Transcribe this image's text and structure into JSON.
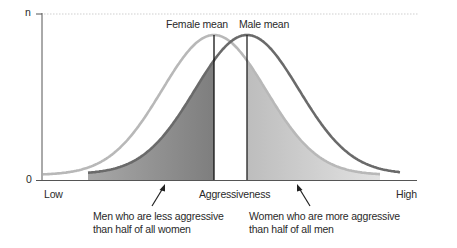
{
  "chart_data": {
    "type": "area",
    "title": "",
    "xlabel": "Aggressiveness",
    "ylabel": "",
    "x_ticks": [
      "Low",
      "High"
    ],
    "y_ticks": [
      "0",
      "n"
    ],
    "series": [
      {
        "name": "Female",
        "mean_label": "Female mean",
        "relative_mean": 0.47,
        "color": "#b5b5b5"
      },
      {
        "name": "Male",
        "mean_label": "Male mean",
        "relative_mean": 0.57,
        "color": "#6e6e6e"
      }
    ],
    "shaded_regions": [
      {
        "label": "Men who are less aggressive than half of all women",
        "series": "Male",
        "range": "below female mean",
        "color": "#8c8c8c"
      },
      {
        "label": "Women who are more aggressive than half of all men",
        "series": "Female",
        "range": "above male mean",
        "color": "#d4d4d4"
      }
    ],
    "grid": false,
    "top_reference_line": "dotted at n"
  },
  "labels": {
    "y_top": "n",
    "y_zero": "0",
    "x_low": "Low",
    "x_high": "High",
    "x_axis": "Aggressiveness",
    "female_mean": "Female mean",
    "male_mean": "Male mean",
    "ann_left_1": "Men who are less aggressive",
    "ann_left_2": "than half of all women",
    "ann_right_1": "Women who are more aggressive",
    "ann_right_2": "than half of all men"
  },
  "colors": {
    "female_curve": "#b5b5b5",
    "male_curve": "#6e6e6e",
    "dark_fill": "#8c8c8c",
    "light_fill": "#d6d6d6",
    "axis": "#555555"
  }
}
